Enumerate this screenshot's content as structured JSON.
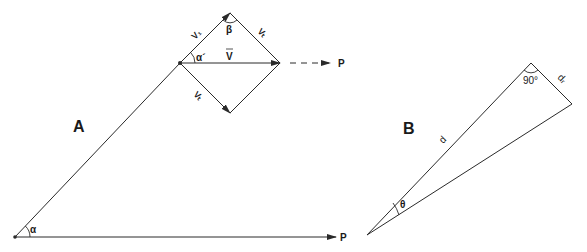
{
  "figure": {
    "panel_a": {
      "label": "A",
      "angle_alpha": "α",
      "angle_alpha_prime": "α´",
      "angle_beta": "β",
      "vector_v": "V",
      "vector_v1": "V₁",
      "vector_vt_upper": "Vₜ",
      "vector_vt_lower": "Vₜ",
      "direction_p_upper": "P",
      "direction_p_lower": "P"
    },
    "panel_b": {
      "label": "B",
      "angle_theta": "θ",
      "right_angle": "90°",
      "side_d": "d",
      "side_dr": "dᵣ"
    },
    "colors": {
      "stroke": "#2a2a2a",
      "background": "#ffffff"
    }
  }
}
